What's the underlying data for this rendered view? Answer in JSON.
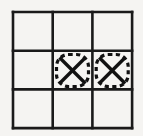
{
  "figure": {
    "background_color": "#f5f4f2",
    "line_color": "#1a1a1a",
    "mark_color": "#111111",
    "highlight_color": "#111111",
    "width": 143,
    "height": 136
  },
  "grid": {
    "rows": 3,
    "columns": 3,
    "origin_x": 13,
    "origin_y": 12,
    "cell_width": 39.7,
    "cell_height": 38.7,
    "line_width": 2.6,
    "x_lines": [
      13,
      52.7,
      92.4,
      132.1
    ],
    "y_lines": [
      12,
      50.7,
      89.4,
      128.1
    ],
    "row_labels": [
      "top",
      "middle",
      "bottom"
    ],
    "column_labels": [
      "left",
      "center",
      "right"
    ]
  },
  "cells": [
    {
      "id": "cell-r1c1",
      "row": 0,
      "col": 0,
      "mark": "",
      "highlighted": false
    },
    {
      "id": "cell-r1c2",
      "row": 0,
      "col": 1,
      "mark": "",
      "highlighted": false
    },
    {
      "id": "cell-r1c3",
      "row": 0,
      "col": 2,
      "mark": "",
      "highlighted": false
    },
    {
      "id": "cell-r2c1",
      "row": 1,
      "col": 0,
      "mark": "",
      "highlighted": false
    },
    {
      "id": "cell-r2c2",
      "row": 1,
      "col": 1,
      "mark": "X",
      "highlighted": true
    },
    {
      "id": "cell-r2c3",
      "row": 1,
      "col": 2,
      "mark": "X",
      "highlighted": true
    },
    {
      "id": "cell-r3c1",
      "row": 2,
      "col": 0,
      "mark": "",
      "highlighted": false
    },
    {
      "id": "cell-r3c2",
      "row": 2,
      "col": 1,
      "mark": "",
      "highlighted": false
    },
    {
      "id": "cell-r3c3",
      "row": 2,
      "col": 2,
      "mark": "",
      "highlighted": false
    }
  ],
  "marks": [
    {
      "symbol": "X",
      "cell": "cell-r2c2",
      "center_x": 72.5,
      "center_y": 70.5,
      "half_size": 13,
      "stroke_width": 3.4
    },
    {
      "symbol": "X",
      "cell": "cell-r2c3",
      "center_x": 112.2,
      "center_y": 70.5,
      "half_size": 13,
      "stroke_width": 3.4
    }
  ],
  "highlights": [
    {
      "cell": "cell-r2c2",
      "style": "dashed-rounded-rectangle",
      "x": 56.5,
      "y": 54.5,
      "width": 32,
      "height": 32,
      "rx": 12,
      "dash": "4.2 3.4",
      "stroke_width": 3.2
    },
    {
      "cell": "cell-r2c3",
      "style": "dashed-rounded-rectangle",
      "x": 96.2,
      "y": 54.5,
      "width": 32,
      "height": 32,
      "rx": 12,
      "dash": "4.2 3.4",
      "stroke_width": 3.2
    }
  ]
}
